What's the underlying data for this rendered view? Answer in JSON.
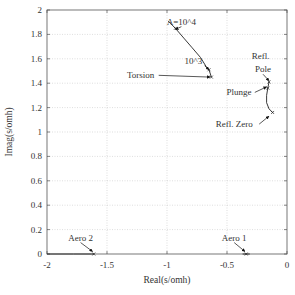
{
  "chart_data": {
    "type": "line",
    "title": "",
    "xlabel": "Real(s/omh)",
    "ylabel": "Imag(s/omh)",
    "xlim": [
      -2,
      0
    ],
    "ylim": [
      0,
      2
    ],
    "grid": true,
    "x_ticks": [
      "-2",
      "-1.5",
      "-1",
      "-0.5",
      "0"
    ],
    "y_ticks": [
      "0",
      "0.2",
      "0.4",
      "0.6",
      "0.8",
      "1",
      "1.2",
      "1.4",
      "1.6",
      "1.8",
      "2"
    ],
    "series": [
      {
        "name": "Torsion",
        "points": [
          [
            -0.99,
            1.91
          ],
          [
            -0.93,
            1.85
          ],
          [
            -0.86,
            1.77
          ],
          [
            -0.79,
            1.69
          ],
          [
            -0.72,
            1.61
          ],
          [
            -0.67,
            1.53
          ],
          [
            -0.65,
            1.51
          ],
          [
            -0.63,
            1.45
          ]
        ]
      },
      {
        "name": "Refl. Pole / Plunge / Refl. Zero",
        "points": [
          [
            -0.15,
            1.41
          ],
          [
            -0.16,
            1.36
          ],
          [
            -0.17,
            1.3
          ],
          [
            -0.17,
            1.24
          ],
          [
            -0.15,
            1.19
          ],
          [
            -0.12,
            1.16
          ]
        ]
      },
      {
        "name": "Aero 2",
        "points": [
          [
            -2.0,
            0.0
          ],
          [
            -1.78,
            0.0
          ],
          [
            -1.63,
            0.0
          ],
          [
            -1.61,
            0.0
          ]
        ]
      },
      {
        "name": "Aero 1",
        "points": [
          [
            -0.37,
            0.0
          ],
          [
            -0.34,
            0.0
          ],
          [
            -0.31,
            0.0
          ]
        ]
      }
    ],
    "markers": [
      {
        "label": "A=10^4",
        "x": -0.93,
        "y": 1.85
      },
      {
        "label": "10^3",
        "x": -0.65,
        "y": 1.51
      },
      {
        "label": "Torsion end",
        "x": -0.63,
        "y": 1.45
      },
      {
        "label": "Refl. Pole",
        "x": -0.15,
        "y": 1.41
      },
      {
        "label": "Plunge",
        "x": -0.16,
        "y": 1.36
      },
      {
        "label": "Refl. Zero",
        "x": -0.12,
        "y": 1.16
      },
      {
        "label": "Aero 2",
        "x": -1.61,
        "y": 0.0
      },
      {
        "label": "Aero 1",
        "x": -0.34,
        "y": 0.0
      }
    ],
    "annotations": [
      {
        "text": "A=10^4",
        "text_x": -0.88,
        "text_y": 1.88,
        "arrow_to": [
          -0.93,
          1.84
        ]
      },
      {
        "text": "10^3",
        "text_x": -0.78,
        "text_y": 1.56,
        "arrow_to": [
          -0.65,
          1.51
        ]
      },
      {
        "text": "Torsion",
        "text_x": -1.22,
        "text_y": 1.44,
        "arrow_to": [
          -0.64,
          1.45
        ]
      },
      {
        "text": "Refl.",
        "text_x": -0.22,
        "text_y": 1.6,
        "arrow_to": null
      },
      {
        "text": "Pole",
        "text_x": -0.2,
        "text_y": 1.49,
        "arrow_to": [
          -0.15,
          1.42
        ]
      },
      {
        "text": "Plunge",
        "text_x": -0.4,
        "text_y": 1.3,
        "arrow_to": [
          -0.17,
          1.37
        ]
      },
      {
        "text": "Refl. Zero",
        "text_x": -0.44,
        "text_y": 1.04,
        "arrow_to": [
          -0.15,
          1.13
        ]
      },
      {
        "text": "Aero 2",
        "text_x": -1.72,
        "text_y": 0.11,
        "arrow_to": [
          -1.62,
          0.02
        ]
      },
      {
        "text": "Aero 1",
        "text_x": -0.44,
        "text_y": 0.11,
        "arrow_to": [
          -0.35,
          0.02
        ]
      }
    ]
  }
}
